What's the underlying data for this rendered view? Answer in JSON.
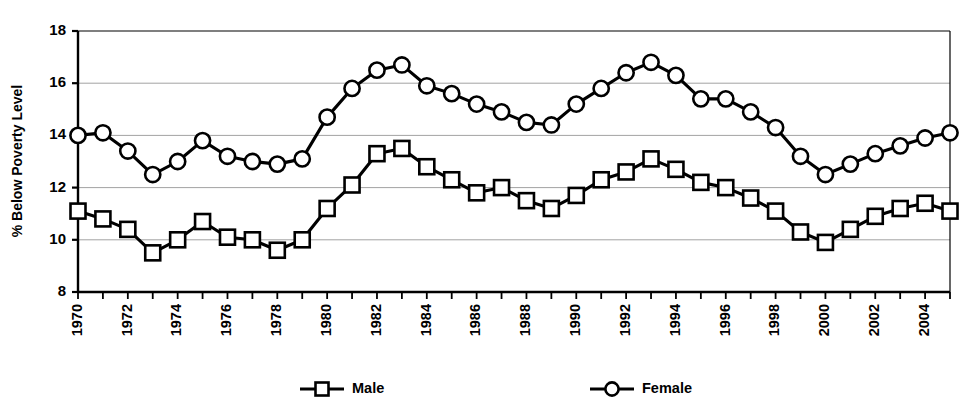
{
  "chart_data": {
    "type": "line",
    "title": "",
    "xlabel": "",
    "ylabel": "% Below Poverty Level",
    "ylim": [
      8,
      18
    ],
    "ytick_values": [
      8,
      10,
      12,
      14,
      16,
      18
    ],
    "ytick_labels": [
      "8",
      "10",
      "12",
      "14",
      "16",
      "18"
    ],
    "xlim": [
      1970,
      2005
    ],
    "x": [
      1970,
      1971,
      1972,
      1973,
      1974,
      1975,
      1976,
      1977,
      1978,
      1979,
      1980,
      1981,
      1982,
      1983,
      1984,
      1985,
      1986,
      1987,
      1988,
      1989,
      1990,
      1991,
      1992,
      1993,
      1994,
      1995,
      1996,
      1997,
      1998,
      1999,
      2000,
      2001,
      2002,
      2003,
      2004,
      2005
    ],
    "xtick_labels": [
      "1970",
      "1972",
      "1974",
      "1976",
      "1978",
      "1980",
      "1982",
      "1984",
      "1986",
      "1988",
      "1990",
      "1992",
      "1994",
      "1996",
      "1998",
      "2000",
      "2002",
      "2004"
    ],
    "xtick_values": [
      1970,
      1972,
      1974,
      1976,
      1978,
      1980,
      1982,
      1984,
      1986,
      1988,
      1990,
      1992,
      1994,
      1996,
      1998,
      2000,
      2002,
      2004
    ],
    "xtick_label_rotation": -90,
    "grid": true,
    "grid_axis": "y",
    "legend_position": "bottom",
    "series": [
      {
        "name": "Male",
        "marker": "square",
        "color": "#000000",
        "values": [
          11.1,
          10.8,
          10.4,
          9.5,
          10.0,
          10.7,
          10.1,
          10.0,
          9.6,
          10.0,
          11.2,
          12.1,
          13.3,
          13.5,
          12.8,
          12.3,
          11.8,
          12.0,
          11.5,
          11.2,
          11.7,
          12.3,
          12.6,
          13.1,
          12.7,
          12.2,
          12.0,
          11.6,
          11.1,
          10.3,
          9.9,
          10.4,
          10.9,
          11.2,
          11.4,
          11.1
        ]
      },
      {
        "name": "Female",
        "marker": "circle",
        "color": "#000000",
        "values": [
          14.0,
          14.1,
          13.4,
          12.5,
          13.0,
          13.8,
          13.2,
          13.0,
          12.9,
          13.1,
          14.7,
          15.8,
          16.5,
          16.7,
          15.9,
          15.6,
          15.2,
          14.9,
          14.5,
          14.4,
          15.2,
          15.8,
          16.4,
          16.8,
          16.3,
          15.4,
          15.4,
          14.9,
          14.3,
          13.2,
          12.5,
          12.9,
          13.3,
          13.6,
          13.9,
          14.1
        ]
      }
    ]
  },
  "legend": {
    "entries": [
      {
        "label": "Male",
        "marker": "square"
      },
      {
        "label": "Female",
        "marker": "circle"
      }
    ]
  }
}
